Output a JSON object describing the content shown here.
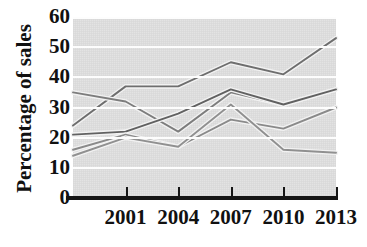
{
  "chart_data": {
    "type": "line",
    "title": "",
    "xlabel": "",
    "ylabel": "Percentage of sales",
    "x": [
      1998,
      2001,
      2004,
      2007,
      2010,
      2013
    ],
    "xtick_labels": [
      "2001",
      "2004",
      "2007",
      "2010",
      "2013"
    ],
    "xtick_values": [
      2001,
      2004,
      2007,
      2010,
      2013
    ],
    "ytick_labels": [
      "60",
      "50",
      "40",
      "30",
      "20",
      "10",
      "0"
    ],
    "ytick_values": [
      60,
      50,
      40,
      30,
      20,
      10,
      0
    ],
    "ylim": [
      0,
      60
    ],
    "xlim": [
      1998,
      2013
    ],
    "grid": true,
    "grid_color": "#fdfdfd",
    "plot_background": "#e3e3e3",
    "legend": "none",
    "series": [
      {
        "name": "series-1",
        "color": "#6e6e6e",
        "values": [
          24,
          37,
          37,
          45,
          41,
          53
        ]
      },
      {
        "name": "series-2",
        "color": "#7d7d7d",
        "values": [
          35,
          32,
          22,
          35,
          31,
          36
        ]
      },
      {
        "name": "series-3",
        "color": "#616161",
        "values": [
          21,
          22,
          28,
          36,
          31,
          36
        ]
      },
      {
        "name": "series-4",
        "color": "#8a8a8a",
        "values": [
          16,
          21,
          17,
          26,
          23,
          30
        ]
      },
      {
        "name": "series-5",
        "color": "#909090",
        "values": [
          14,
          20,
          17,
          31,
          16,
          15
        ]
      }
    ]
  },
  "axes": {
    "y_axis_label": "Percentage of sales",
    "y_ticks": [
      "60",
      "50",
      "40",
      "30",
      "20",
      "10",
      "0"
    ],
    "x_ticks": [
      "2001",
      "2004",
      "2007",
      "2010",
      "2013"
    ]
  }
}
